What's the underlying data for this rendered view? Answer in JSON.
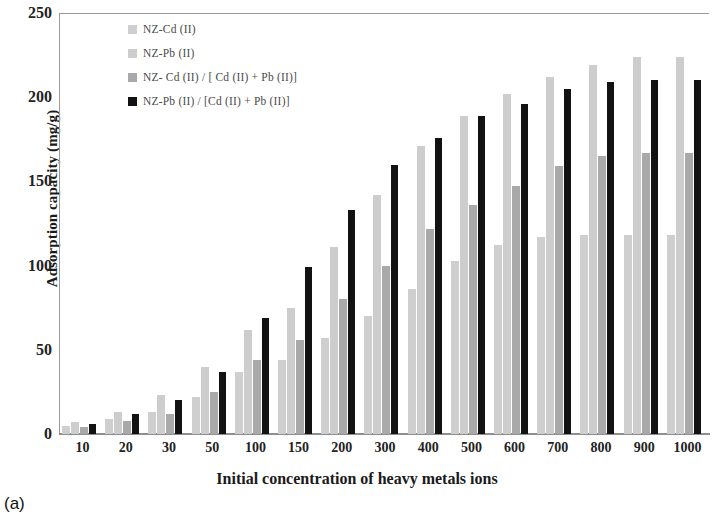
{
  "figure": {
    "caption": "(a)"
  },
  "chart_data": {
    "type": "bar",
    "title": "",
    "xlabel": "Initial concentration of heavy metals ions",
    "ylabel": "Adsorption capacity (mg/g)",
    "ylim": [
      0,
      250
    ],
    "yticks": [
      0,
      50,
      100,
      150,
      200,
      250
    ],
    "grid": false,
    "legend_position": "top-left-inside",
    "categories": [
      "10",
      "20",
      "30",
      "50",
      "100",
      "150",
      "200",
      "300",
      "400",
      "500",
      "600",
      "700",
      "800",
      "900",
      "1000"
    ],
    "series": [
      {
        "name": "NZ-Cd (II)",
        "color": "#cfcfcf",
        "values": [
          5,
          9,
          13,
          22,
          37,
          44,
          57,
          70,
          86,
          103,
          112,
          117,
          118,
          118,
          118
        ]
      },
      {
        "name": "NZ-Pb (II)",
        "color": "#cdcdcd",
        "values": [
          7,
          13,
          23,
          40,
          62,
          75,
          111,
          142,
          171,
          189,
          202,
          212,
          219,
          224,
          224
        ]
      },
      {
        "name": "NZ- Cd (II) / [ Cd (II) + Pb (II)]",
        "color": "#a9a9a9",
        "values": [
          4,
          8,
          12,
          25,
          44,
          56,
          80,
          100,
          122,
          136,
          147,
          159,
          165,
          167,
          167
        ]
      },
      {
        "name": "NZ-Pb (II) / [Cd (II) + Pb (II)]",
        "color": "#121212",
        "values": [
          6,
          12,
          20,
          37,
          69,
          99,
          133,
          160,
          176,
          189,
          196,
          205,
          209,
          210,
          210
        ]
      }
    ]
  }
}
